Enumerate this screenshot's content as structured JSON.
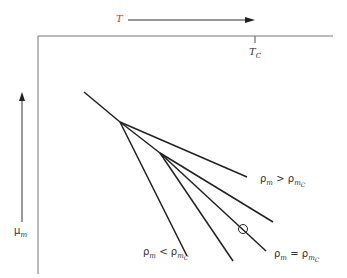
{
  "diagram": {
    "top_axis": {
      "label": "T",
      "arrow": "right-arrow"
    },
    "tick": {
      "label": "T",
      "sub": "C"
    },
    "left_axis": {
      "label": "μ",
      "sub": "m",
      "arrow": "up-arrow"
    },
    "labels": {
      "greater": {
        "rho": "ρ",
        "sub": "m",
        "op": ">",
        "rho2": "ρ",
        "sub2": "m",
        "subsub2": "C"
      },
      "less": {
        "rho": "ρ",
        "sub": "m",
        "op": "<",
        "rho2": "ρ",
        "sub2": "m",
        "subsub2": "C"
      },
      "equal": {
        "rho": "ρ",
        "sub": "m",
        "op": "=",
        "rho2": "ρ",
        "sub2": "m",
        "subsub2": "C"
      }
    },
    "colors": {
      "line": "#222222",
      "axis": "#666666"
    }
  }
}
